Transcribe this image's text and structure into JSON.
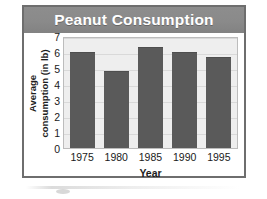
{
  "chart_data": {
    "type": "bar",
    "title": "Peanut Consumption",
    "xlabel": "Year",
    "ylabel": "Average consumption (in lb)",
    "ylabel_lines": [
      "Average",
      "consumption (in lb)"
    ],
    "categories": [
      "1975",
      "1980",
      "1985",
      "1990",
      "1995"
    ],
    "values": [
      6.0,
      4.8,
      6.3,
      6.0,
      5.7
    ],
    "ylim": [
      0,
      7
    ],
    "yticks": [
      7,
      6,
      5,
      4,
      3,
      2,
      1,
      0
    ],
    "grid": true,
    "legend": "none",
    "series": [
      {
        "name": "Average consumption (in lb)",
        "values": [
          6.0,
          4.8,
          6.3,
          6.0,
          5.7
        ]
      }
    ]
  },
  "colors": {
    "title_band": "#8a8a8a",
    "title_text": "#ffffff",
    "bar_fill": "#5a5a5a",
    "plot_background": "#eeeeee",
    "gridline": "#d9d9d9",
    "frame_border": "#6e6e6e",
    "axis_text": "#1a1a1a"
  }
}
